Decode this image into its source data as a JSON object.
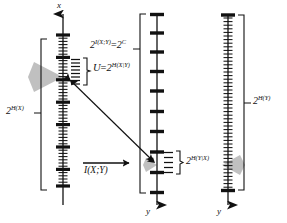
{
  "figure": {
    "type": "diagram",
    "topic": "channel-capacity-typical-sequences",
    "background": "#ffffff",
    "ink_color": "#111111",
    "fan_color": "#b8b8b8",
    "width": 287,
    "height": 223
  },
  "axes": [
    {
      "id": "left-axis",
      "name": "x-axis",
      "variable_label": "x",
      "arrow_direction": "up",
      "tick_style": "dense-small-with-bold-markers",
      "small_tick_count": 46,
      "bold_tick_count": 7
    },
    {
      "id": "middle-axis",
      "name": "y-axis-middle",
      "variable_label": "y",
      "arrow_direction": "down",
      "tick_style": "sparse-bold",
      "bold_tick_count": 10
    },
    {
      "id": "right-axis",
      "name": "y-axis-right",
      "variable_label": "y",
      "arrow_direction": "down",
      "tick_style": "dense-small-with-bold-markers",
      "small_tick_count": 46,
      "bold_tick_count": 2
    }
  ],
  "labels": {
    "axis_x": "x",
    "axis_y_middle": "y",
    "axis_y_right": "y",
    "h_of_x": {
      "base": "2",
      "exponent": "H(X)",
      "full": "2^H(X)"
    },
    "i_xy_equals_c": {
      "base": "2",
      "exponent": "I(X;Y)",
      "equals": "=",
      "base2": "2",
      "exponent2": "C",
      "full": "2^I(X;Y) = 2^C"
    },
    "u_conditional": {
      "name": "U",
      "equals": "=",
      "base": "2",
      "exponent": "H(X|Y)",
      "full": "U = 2^H(X|Y)"
    },
    "h_y_given_x": {
      "base": "2",
      "exponent": "H(Y|X)",
      "full": "2^H(Y|X)"
    },
    "h_of_y": {
      "base": "2",
      "exponent": "H(Y)",
      "full": "2^H(Y)"
    },
    "mutual_information": "I(X;Y)"
  },
  "annotations": {
    "brace_left_label": "2^H(X)",
    "brace_middle_label": "2^I(X;Y) = 2^C",
    "brace_right_label": "2^H(Y)",
    "brace_u_label": "U = 2^H(X|Y)",
    "brace_hyx_label": "2^H(Y|X)",
    "channel_arrow_label": "I(X;Y)",
    "diagonal_arrow": "double-headed-mapping-arrow"
  }
}
